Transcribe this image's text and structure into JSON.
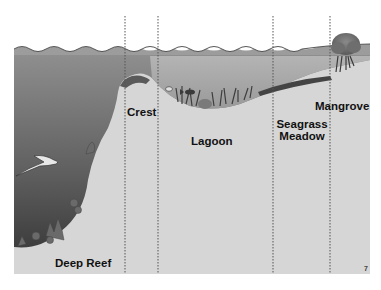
{
  "diagram": {
    "title": "",
    "zones": [
      {
        "id": "deep-reef",
        "label": "Deep Reef"
      },
      {
        "id": "crest",
        "label": "Crest"
      },
      {
        "id": "lagoon",
        "label": "Lagoon"
      },
      {
        "id": "seagrass-meadow",
        "label_line1": "Seagrass",
        "label_line2": "Meadow"
      },
      {
        "id": "mangrove",
        "label": "Mangrove"
      }
    ],
    "corner_mark": "7",
    "colors": {
      "sky": "#ffffff",
      "panel_gray": "#d6d6d6",
      "deep_water_top": "#8a8a8a",
      "deep_water_bottom": "#3e3e3e",
      "shallow_water": "#a8a8a8",
      "divider": "#555555",
      "text": "#111111"
    }
  }
}
